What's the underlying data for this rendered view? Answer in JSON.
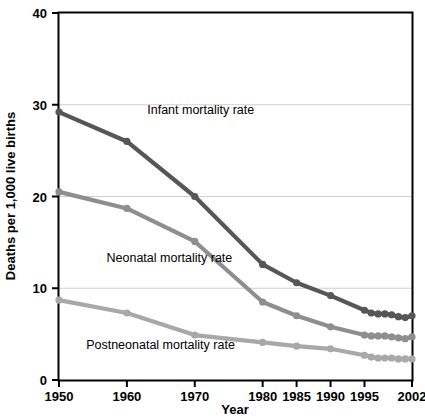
{
  "chart_data": {
    "type": "line",
    "title": "",
    "xlabel": "Year",
    "ylabel": "Deaths per 1,000 live births",
    "xlim": [
      1950,
      2002
    ],
    "ylim": [
      0,
      40
    ],
    "grid": true,
    "grid_axis": "y",
    "legend": "inline-annotations",
    "x_ticks": [
      1950,
      1960,
      1970,
      1980,
      1985,
      1990,
      1995,
      2002
    ],
    "x_tick_labels": [
      "1950",
      "1960",
      "1970",
      "1980",
      "1985",
      "1990",
      "1995",
      "2002"
    ],
    "y_ticks": [
      0,
      10,
      20,
      30,
      40
    ],
    "y_tick_labels": [
      "0",
      "10",
      "20",
      "30",
      "40"
    ],
    "series": [
      {
        "name": "Infant mortality rate",
        "color": "#565656",
        "label_x": 1963,
        "label_y": 29.0,
        "x": [
          1950,
          1960,
          1970,
          1980,
          1985,
          1990,
          1995,
          1996,
          1997,
          1998,
          1999,
          2000,
          2001,
          2002
        ],
        "values": [
          29.2,
          26.0,
          20.0,
          12.6,
          10.6,
          9.2,
          7.6,
          7.3,
          7.2,
          7.2,
          7.1,
          6.9,
          6.8,
          7.0
        ]
      },
      {
        "name": "Neonatal mortality rate",
        "color": "#8e8e8e",
        "label_x": 1957,
        "label_y": 12.9,
        "x": [
          1950,
          1960,
          1970,
          1980,
          1985,
          1990,
          1995,
          1996,
          1997,
          1998,
          1999,
          2000,
          2001,
          2002
        ],
        "values": [
          20.5,
          18.7,
          15.1,
          8.5,
          7.0,
          5.8,
          4.9,
          4.8,
          4.8,
          4.8,
          4.7,
          4.6,
          4.5,
          4.7
        ]
      },
      {
        "name": "Postneonatal mortality rate",
        "color": "#a8a8a8",
        "label_x": 1954,
        "label_y": 3.4,
        "x": [
          1950,
          1960,
          1970,
          1980,
          1985,
          1990,
          1995,
          1996,
          1997,
          1998,
          1999,
          2000,
          2001,
          2002
        ],
        "values": [
          8.7,
          7.3,
          4.9,
          4.1,
          3.7,
          3.4,
          2.7,
          2.5,
          2.4,
          2.4,
          2.4,
          2.3,
          2.3,
          2.3
        ]
      }
    ]
  },
  "axis": {
    "x_title": "Year",
    "y_title": "Deaths per 1,000 live births"
  }
}
